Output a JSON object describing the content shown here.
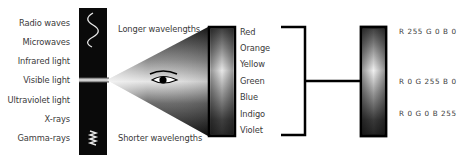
{
  "spectrum": {
    "labels": [
      "Radio waves",
      "Microwaves",
      "Infrared light",
      "Visible light",
      "Ultraviolet light",
      "X-rays",
      "Gamma-rays"
    ],
    "top_icon": "long-wave-icon",
    "bottom_icon": "short-wave-icon"
  },
  "cone": {
    "top_label": "Longer wavelengths",
    "bottom_label": "Shorter wavelengths",
    "icon": "eye-icon"
  },
  "visible_colors": [
    "Red",
    "Orange",
    "Yellow",
    "Green",
    "Blue",
    "Indigo",
    "Violet"
  ],
  "rgb": {
    "labels": [
      "R 255 G 0 B 0",
      "R 0 G 255 B 0",
      "R 0 G 0 B 255"
    ]
  },
  "colors": {
    "bar": "#0a0a0a",
    "line": "#000000",
    "text": "#3a3a3a"
  }
}
